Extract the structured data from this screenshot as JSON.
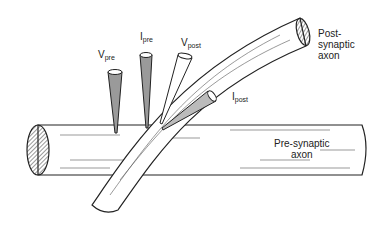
{
  "diagram": {
    "labels": {
      "v_pre": {
        "main": "V",
        "sub": "pre"
      },
      "i_pre": {
        "main": "I",
        "sub": "pre"
      },
      "v_post": {
        "main": "V",
        "sub": "post"
      },
      "i_post": {
        "main": "I",
        "sub": "post"
      },
      "post_axon": [
        "Post-",
        "synaptic",
        "axon"
      ],
      "pre_axon": [
        "Pre-synaptic",
        "axon"
      ]
    },
    "colors": {
      "ink": "#222222",
      "shade": "#9a9a9a",
      "background": "#ffffff"
    }
  }
}
